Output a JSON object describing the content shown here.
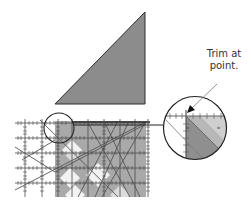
{
  "figure": {
    "type": "quilting-instruction-diagram",
    "callout": {
      "line1": "Trim at",
      "line2": "point."
    },
    "colors": {
      "triangle_fill": "#8c8c8c",
      "fabric_fill": "#a9a9a9",
      "fabric_light": "#f2f2f2",
      "ruler_line": "#5a5a5a",
      "outline": "#333333",
      "magnifier_fabric": "#b8b8b8",
      "magnifier_dark": "#8f8f8f"
    },
    "elements": [
      {
        "name": "half-square-triangle",
        "description": "dark gray right triangle piece"
      },
      {
        "name": "ruler-over-fabric",
        "description": "quilting ruler laid over pieced fabric block"
      },
      {
        "name": "detail-circle-small",
        "description": "circled corner area on block"
      },
      {
        "name": "detail-magnifier",
        "description": "enlarged view of circled corner"
      },
      {
        "name": "callout-arrow",
        "description": "arrow pointing to trim point"
      }
    ]
  }
}
